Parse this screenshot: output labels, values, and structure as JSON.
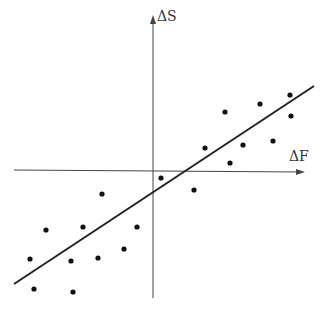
{
  "chart_data": {
    "type": "scatter",
    "title": "",
    "xlabel": "ΔF",
    "ylabel": "ΔS",
    "grid": false,
    "legend": null,
    "note": "Schematic scatter with fitted regression line; axes without tick labels. Coordinates in pixel space (origin at axis intersection, y up).",
    "points_px": [
      [
        205,
        148
      ],
      [
        225,
        112
      ],
      [
        260,
        104
      ],
      [
        290,
        95
      ],
      [
        291,
        116
      ],
      [
        243,
        145
      ],
      [
        273,
        141
      ],
      [
        230,
        163
      ],
      [
        194,
        190
      ],
      [
        161,
        178
      ],
      [
        102,
        194
      ],
      [
        46,
        230
      ],
      [
        83,
        227
      ],
      [
        137,
        227
      ],
      [
        30,
        259
      ],
      [
        71,
        261
      ],
      [
        98,
        258
      ],
      [
        124,
        249
      ],
      [
        34,
        289
      ],
      [
        73,
        292
      ]
    ],
    "regression_line_px": [
      [
        14,
        284
      ],
      [
        314,
        86
      ]
    ],
    "axes_px": {
      "origin": [
        153,
        170
      ],
      "x_from": 14,
      "x_to": 305,
      "y_from": 298,
      "y_to": 15
    }
  },
  "labels": {
    "x_axis": "ΔF",
    "y_axis": "ΔS"
  }
}
